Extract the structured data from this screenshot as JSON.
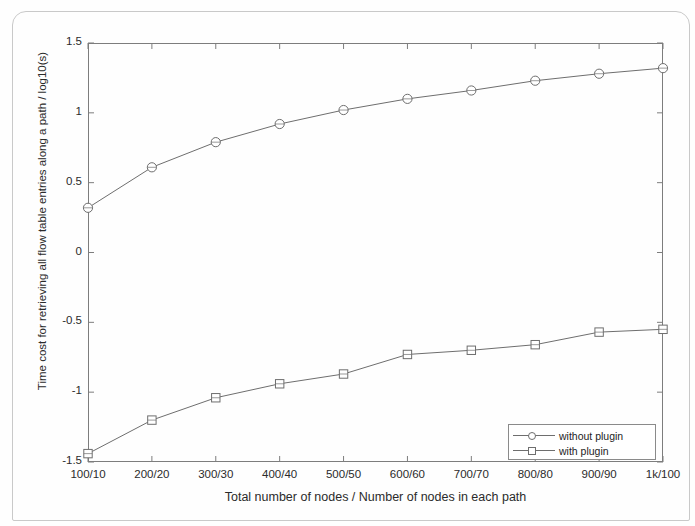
{
  "figure": {
    "xlabel": "Total number of nodes / Number of nodes in each path",
    "ylabel": "Time cost for retrieving all flow table entries along a path / log10(s)",
    "ytick_labels": [
      "1.5",
      "1",
      "0.5",
      "0",
      "-0.5",
      "-1",
      "-1.5"
    ],
    "xtick_labels": [
      "100/10",
      "200/20",
      "300/30",
      "400/40",
      "500/50",
      "600/60",
      "700/70",
      "800/80",
      "900/90",
      "1k/100"
    ],
    "legend": {
      "position": "lower-right",
      "entries": [
        {
          "label": "without plugin",
          "marker": "circle-marker"
        },
        {
          "label": "with plugin",
          "marker": "square-marker"
        }
      ]
    },
    "colors": {
      "axis": "#7d7d7d",
      "line": "#6e6e6e",
      "text": "#2b2b2b",
      "page_border": "#c9c9c9"
    }
  },
  "chart_data": {
    "type": "line",
    "title": "",
    "xlabel": "Total number of nodes / Number of nodes in each path",
    "ylabel": "Time cost for retrieving all flow table entries along a path / log10(s)",
    "categories": [
      "100/10",
      "200/20",
      "300/30",
      "400/40",
      "500/50",
      "600/60",
      "700/70",
      "800/80",
      "900/90",
      "1k/100"
    ],
    "ylim": [
      -1.5,
      1.5
    ],
    "yticks": [
      -1.5,
      -1,
      -0.5,
      0,
      0.5,
      1,
      1.5
    ],
    "grid": false,
    "legend_position": "lower right",
    "series": [
      {
        "name": "without plugin",
        "marker": "circle",
        "values": [
          0.32,
          0.61,
          0.79,
          0.92,
          1.02,
          1.1,
          1.16,
          1.23,
          1.28,
          1.32
        ]
      },
      {
        "name": "with plugin",
        "marker": "square",
        "values": [
          -1.44,
          -1.2,
          -1.04,
          -0.94,
          -0.87,
          -0.73,
          -0.7,
          -0.66,
          -0.57,
          -0.55
        ]
      }
    ]
  }
}
